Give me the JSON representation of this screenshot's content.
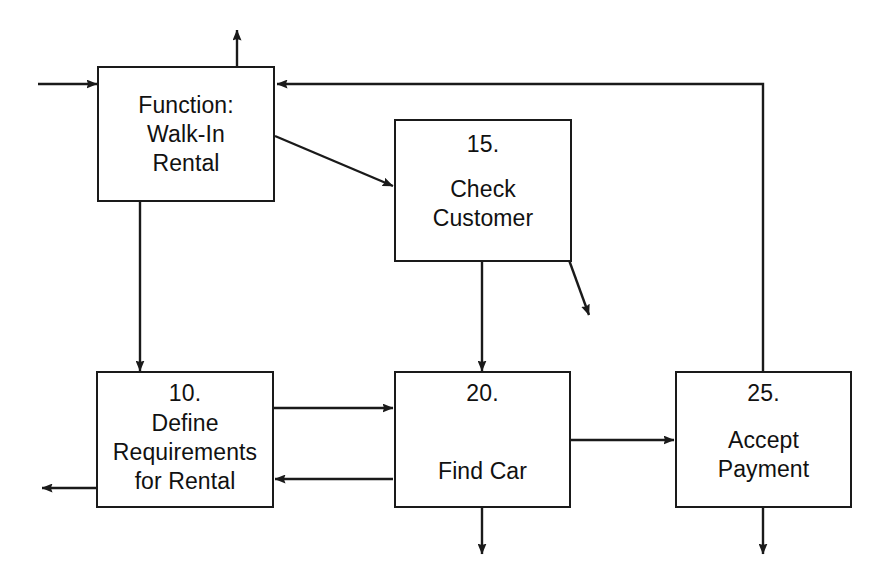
{
  "diagram": {
    "type": "process-flow-diagram",
    "background_color": "#ffffff",
    "line_color": "#1a1a1a",
    "text_color": "#111111",
    "nodes": [
      {
        "id": "function",
        "number": "",
        "label": "Function:\nWalk-In\nRental",
        "x": 97,
        "y": 66,
        "w": 178,
        "h": 136
      },
      {
        "id": "check_customer",
        "number": "15.",
        "label": "Check\nCustomer",
        "x": 394,
        "y": 119,
        "w": 178,
        "h": 143
      },
      {
        "id": "define_requirements",
        "number": "10.",
        "label": "Define\nRequirements\nfor Rental",
        "x": 96,
        "y": 371,
        "w": 178,
        "h": 137
      },
      {
        "id": "find_car",
        "number": "20.",
        "label": "Find Car",
        "x": 394,
        "y": 371,
        "w": 177,
        "h": 137
      },
      {
        "id": "accept_payment",
        "number": "25.",
        "label": "Accept\nPayment",
        "x": 675,
        "y": 371,
        "w": 177,
        "h": 137
      }
    ],
    "edges": [
      {
        "id": "external-input-to-function",
        "from": "external-left",
        "to": "function",
        "style": "straight-horizontal"
      },
      {
        "id": "function-output-up",
        "from": "function",
        "to": "external-top",
        "style": "straight-vertical"
      },
      {
        "id": "function-to-check-customer",
        "from": "function",
        "to": "check_customer",
        "style": "diagonal"
      },
      {
        "id": "function-to-define-requirements",
        "from": "function",
        "to": "define_requirements",
        "style": "straight-vertical"
      },
      {
        "id": "check-customer-to-find-car",
        "from": "check_customer",
        "to": "find_car",
        "style": "straight-vertical"
      },
      {
        "id": "check-customer-output-diagonal",
        "from": "check_customer",
        "to": "external-right",
        "style": "diagonal"
      },
      {
        "id": "define-requirements-to-find-car",
        "from": "define_requirements",
        "to": "find_car",
        "style": "straight-horizontal"
      },
      {
        "id": "find-car-to-define-requirements",
        "from": "find_car",
        "to": "define_requirements",
        "style": "straight-horizontal"
      },
      {
        "id": "define-requirements-output-left",
        "from": "define_requirements",
        "to": "external-left",
        "style": "straight-horizontal"
      },
      {
        "id": "find-car-to-accept-payment",
        "from": "find_car",
        "to": "accept_payment",
        "style": "straight-horizontal"
      },
      {
        "id": "find-car-output-down",
        "from": "find_car",
        "to": "external-bottom",
        "style": "straight-vertical"
      },
      {
        "id": "accept-payment-output-down",
        "from": "accept_payment",
        "to": "external-bottom",
        "style": "straight-vertical"
      },
      {
        "id": "accept-payment-feedback-to-function",
        "from": "accept_payment",
        "to": "function",
        "style": "orthogonal-feedback"
      }
    ]
  }
}
